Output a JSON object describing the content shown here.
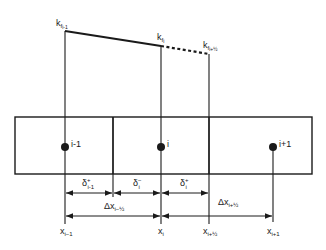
{
  "diagram": {
    "type": "1D finite-volume grid with interface permeabilities",
    "line_color": "#1a1a1a",
    "background": "#ffffff",
    "permeability_labels": {
      "k_prev": {
        "base": "k",
        "sub": "f",
        "subsub": "i-1"
      },
      "k_curr": {
        "base": "k",
        "sub": "f",
        "subsub": "i"
      },
      "k_half": {
        "base": "k",
        "sub": "f",
        "subsub": "i+½"
      }
    },
    "nodes": [
      {
        "id": "node-i-minus-1",
        "label": "i-1"
      },
      {
        "id": "node-i",
        "label": "i"
      },
      {
        "id": "node-i-plus-1",
        "label": "i+1"
      }
    ],
    "delta_labels": [
      {
        "base": "δ",
        "sup": "+",
        "sub": "i-1"
      },
      {
        "base": "δ",
        "sup": "−",
        "sub": "i"
      },
      {
        "base": "δ",
        "sup": "+",
        "sub": "i"
      }
    ],
    "spacing_labels": [
      {
        "base": "Δx",
        "sub": "i−½"
      },
      {
        "base": "Δx",
        "sub": "i+½"
      }
    ],
    "axis_labels": [
      {
        "base": "x",
        "sub": "i−1"
      },
      {
        "base": "x",
        "sub": "i"
      },
      {
        "base": "x",
        "sub": "i+½"
      },
      {
        "base": "x",
        "sub": "i+1"
      }
    ]
  }
}
